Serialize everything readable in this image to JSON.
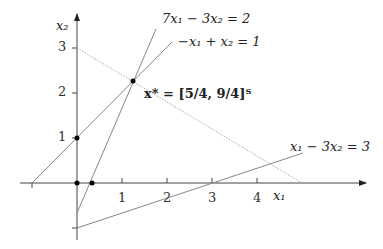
{
  "diagram": {
    "axes": {
      "x_label": "x₁",
      "y_label": "x₂"
    },
    "x_ticks": [
      "1",
      "2",
      "3",
      "4"
    ],
    "y_ticks": [
      "1",
      "2",
      "3"
    ],
    "lines": [
      {
        "label": "7x₁ − 3x₂ = 2"
      },
      {
        "label": "−x₁ + x₂ = 1"
      },
      {
        "label": "x₁ − 3x₂ = 3"
      }
    ],
    "solution_label": "x* = [5/4, 9/4]ᵀ",
    "solution_point": {
      "x1": 1.25,
      "x2": 2.25
    },
    "colors": {
      "axis": "#333333",
      "line": "#888888",
      "dotted": "#aaaaaa",
      "point": "#000000"
    }
  }
}
